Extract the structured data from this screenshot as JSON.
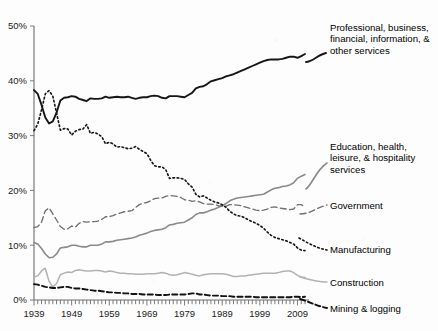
{
  "chart_data": {
    "type": "line",
    "title": "",
    "xlabel": "",
    "ylabel": "",
    "xlim": [
      1939,
      2011
    ],
    "ylim": [
      0,
      50
    ],
    "grid": false,
    "legend_position": "right-inline-labels",
    "y_tick_labels": [
      "0%",
      "10%",
      "20%",
      "30%",
      "40%",
      "50%"
    ],
    "y_tick_values": [
      0,
      10,
      20,
      30,
      40,
      50
    ],
    "x_tick_labels": [
      "1939",
      "1949",
      "1959",
      "1969",
      "1979",
      "1989",
      "1999",
      "2009"
    ],
    "x_tick_values": [
      1939,
      1949,
      1959,
      1969,
      1979,
      1989,
      1999,
      2009
    ],
    "x_minor_tick_interval": 1,
    "units": "percent of total nonfarm employment",
    "series": [
      {
        "name": "Professional, business, financial, information, & other services",
        "style": "solid-bold-black",
        "color": "#161616",
        "x": [
          1939,
          1940,
          1941,
          1942,
          1943,
          1944,
          1945,
          1946,
          1947,
          1948,
          1949,
          1950,
          1951,
          1952,
          1953,
          1954,
          1955,
          1956,
          1957,
          1958,
          1959,
          1960,
          1961,
          1962,
          1963,
          1964,
          1965,
          1966,
          1967,
          1968,
          1969,
          1970,
          1971,
          1972,
          1973,
          1974,
          1975,
          1976,
          1977,
          1978,
          1979,
          1980,
          1981,
          1982,
          1983,
          1984,
          1985,
          1986,
          1987,
          1988,
          1989,
          1990,
          1991,
          1992,
          1993,
          1994,
          1995,
          1996,
          1997,
          1998,
          1999,
          2000,
          2001,
          2002,
          2003,
          2004,
          2005,
          2006,
          2007,
          2008,
          2009,
          2010,
          2011
        ],
        "values": [
          38.3,
          37.6,
          35.6,
          33.3,
          32.2,
          32.6,
          34.2,
          36.4,
          36.9,
          37.0,
          37.2,
          37.1,
          36.7,
          36.5,
          36.3,
          36.8,
          36.7,
          36.7,
          36.8,
          37.1,
          36.9,
          37.0,
          37.1,
          37.0,
          37.0,
          37.1,
          36.9,
          36.7,
          36.9,
          37.0,
          37.0,
          37.2,
          37.3,
          37.2,
          36.9,
          36.8,
          37.2,
          37.2,
          37.2,
          37.1,
          37.0,
          37.4,
          37.8,
          38.6,
          38.9,
          39.0,
          39.4,
          39.9,
          40.1,
          40.3,
          40.5,
          40.8,
          41.0,
          41.2,
          41.5,
          41.8,
          42.1,
          42.4,
          42.7,
          43.0,
          43.3,
          43.6,
          43.8,
          43.9,
          43.9,
          43.9,
          44.0,
          44.2,
          44.4,
          44.4,
          44.2,
          44.5,
          44.9
        ]
      },
      {
        "name": "Education, health, leisure, & hospitality services",
        "style": "solid-gray",
        "color": "#8a8a8a",
        "x": [
          1939,
          1940,
          1941,
          1942,
          1943,
          1944,
          1945,
          1946,
          1947,
          1948,
          1949,
          1950,
          1951,
          1952,
          1953,
          1954,
          1955,
          1956,
          1957,
          1958,
          1959,
          1960,
          1961,
          1962,
          1963,
          1964,
          1965,
          1966,
          1967,
          1968,
          1969,
          1970,
          1971,
          1972,
          1973,
          1974,
          1975,
          1976,
          1977,
          1978,
          1979,
          1980,
          1981,
          1982,
          1983,
          1984,
          1985,
          1986,
          1987,
          1988,
          1989,
          1990,
          1991,
          1992,
          1993,
          1994,
          1995,
          1996,
          1997,
          1998,
          1999,
          2000,
          2001,
          2002,
          2003,
          2004,
          2005,
          2006,
          2007,
          2008,
          2009,
          2010,
          2011
        ],
        "values": [
          10.5,
          10.2,
          9.4,
          8.4,
          7.7,
          7.8,
          8.4,
          9.5,
          9.6,
          9.7,
          10.0,
          10.0,
          9.8,
          9.7,
          9.7,
          10.0,
          10.0,
          10.0,
          10.2,
          10.6,
          10.6,
          10.7,
          10.9,
          11.0,
          11.1,
          11.2,
          11.3,
          11.5,
          11.8,
          12.0,
          12.2,
          12.5,
          12.7,
          12.8,
          12.9,
          13.2,
          13.7,
          13.8,
          14.0,
          14.1,
          14.2,
          14.6,
          15.0,
          15.6,
          15.9,
          15.9,
          16.1,
          16.4,
          16.6,
          16.9,
          17.2,
          17.6,
          18.1,
          18.4,
          18.6,
          18.7,
          18.8,
          18.9,
          19.0,
          19.1,
          19.2,
          19.3,
          19.7,
          20.1,
          20.4,
          20.5,
          20.7,
          20.8,
          21.0,
          21.4,
          22.2,
          22.6,
          22.9
        ]
      },
      {
        "name": "Government",
        "style": "dashed-gray",
        "color": "#6f6f6f",
        "x": [
          1939,
          1940,
          1941,
          1942,
          1943,
          1944,
          1945,
          1946,
          1947,
          1948,
          1949,
          1950,
          1951,
          1952,
          1953,
          1954,
          1955,
          1956,
          1957,
          1958,
          1959,
          1960,
          1961,
          1962,
          1963,
          1964,
          1965,
          1966,
          1967,
          1968,
          1969,
          1970,
          1971,
          1972,
          1973,
          1974,
          1975,
          1976,
          1977,
          1978,
          1979,
          1980,
          1981,
          1982,
          1983,
          1984,
          1985,
          1986,
          1987,
          1988,
          1989,
          1990,
          1991,
          1992,
          1993,
          1994,
          1995,
          1996,
          1997,
          1998,
          1999,
          2000,
          2001,
          2002,
          2003,
          2004,
          2005,
          2006,
          2007,
          2008,
          2009,
          2010,
          2011
        ],
        "values": [
          13.2,
          13.4,
          14.2,
          16.3,
          16.8,
          15.7,
          14.6,
          13.4,
          12.9,
          13.0,
          13.5,
          13.3,
          14.0,
          14.3,
          14.2,
          14.3,
          14.3,
          14.4,
          14.7,
          15.2,
          15.2,
          15.4,
          15.7,
          15.9,
          16.1,
          16.2,
          16.3,
          16.9,
          17.4,
          17.7,
          17.8,
          18.1,
          18.5,
          18.6,
          18.6,
          18.9,
          19.1,
          19.0,
          18.9,
          18.7,
          18.3,
          18.2,
          18.0,
          18.1,
          17.9,
          17.6,
          17.5,
          17.5,
          17.4,
          17.2,
          17.1,
          17.1,
          17.4,
          17.4,
          17.3,
          17.2,
          17.0,
          16.8,
          16.6,
          16.4,
          16.3,
          16.4,
          16.6,
          16.9,
          17.0,
          16.8,
          16.7,
          16.6,
          16.5,
          16.6,
          17.4,
          17.4,
          17.0
        ]
      },
      {
        "name": "Manufacturing",
        "style": "dotted-black",
        "color": "#181818",
        "x": [
          1939,
          1940,
          1941,
          1942,
          1943,
          1944,
          1945,
          1946,
          1947,
          1948,
          1949,
          1950,
          1951,
          1952,
          1953,
          1954,
          1955,
          1956,
          1957,
          1958,
          1959,
          1960,
          1961,
          1962,
          1963,
          1964,
          1965,
          1966,
          1967,
          1968,
          1969,
          1970,
          1971,
          1972,
          1973,
          1974,
          1975,
          1976,
          1977,
          1978,
          1979,
          1980,
          1981,
          1982,
          1983,
          1984,
          1985,
          1986,
          1987,
          1988,
          1989,
          1990,
          1991,
          1992,
          1993,
          1994,
          1995,
          1996,
          1997,
          1998,
          1999,
          2000,
          2001,
          2002,
          2003,
          2004,
          2005,
          2006,
          2007,
          2008,
          2009,
          2010,
          2011
        ],
        "values": [
          30.9,
          32.1,
          34.7,
          37.6,
          38.2,
          37.2,
          34.1,
          31.0,
          31.3,
          31.2,
          30.1,
          30.8,
          31.1,
          31.2,
          32.0,
          30.4,
          30.6,
          30.3,
          29.8,
          28.5,
          28.8,
          28.5,
          27.9,
          28.0,
          27.8,
          27.6,
          27.7,
          28.0,
          27.5,
          27.1,
          26.7,
          25.5,
          24.5,
          24.3,
          24.3,
          23.8,
          22.2,
          22.3,
          22.3,
          22.2,
          22.0,
          21.2,
          20.6,
          19.3,
          18.8,
          19.0,
          18.6,
          18.2,
          17.9,
          17.7,
          17.4,
          16.9,
          16.2,
          15.7,
          15.4,
          15.3,
          15.0,
          14.6,
          14.3,
          14.0,
          13.6,
          13.1,
          12.4,
          11.8,
          11.4,
          11.2,
          11.0,
          10.8,
          10.5,
          10.2,
          9.5,
          9.1,
          9.0
        ]
      },
      {
        "name": "Construction",
        "style": "solid-lightgray",
        "color": "#b2b2b2",
        "x": [
          1939,
          1940,
          1941,
          1942,
          1943,
          1944,
          1945,
          1946,
          1947,
          1948,
          1949,
          1950,
          1951,
          1952,
          1953,
          1954,
          1955,
          1956,
          1957,
          1958,
          1959,
          1960,
          1961,
          1962,
          1963,
          1964,
          1965,
          1966,
          1967,
          1968,
          1969,
          1970,
          1971,
          1972,
          1973,
          1974,
          1975,
          1976,
          1977,
          1978,
          1979,
          1980,
          1981,
          1982,
          1983,
          1984,
          1985,
          1986,
          1987,
          1988,
          1989,
          1990,
          1991,
          1992,
          1993,
          1994,
          1995,
          1996,
          1997,
          1998,
          1999,
          2000,
          2001,
          2002,
          2003,
          2004,
          2005,
          2006,
          2007,
          2008,
          2009,
          2010,
          2011
        ],
        "values": [
          4.2,
          4.4,
          5.3,
          5.8,
          3.4,
          2.4,
          3.0,
          4.6,
          4.9,
          5.1,
          5.0,
          5.4,
          5.5,
          5.4,
          5.3,
          5.3,
          5.4,
          5.4,
          5.3,
          5.1,
          5.3,
          5.2,
          5.0,
          4.9,
          4.9,
          4.8,
          4.8,
          4.7,
          4.7,
          4.7,
          4.8,
          4.8,
          4.8,
          4.9,
          5.0,
          4.9,
          4.6,
          4.5,
          4.6,
          4.8,
          5.0,
          4.9,
          4.7,
          4.5,
          4.4,
          4.6,
          4.7,
          4.8,
          4.8,
          4.8,
          4.8,
          4.7,
          4.5,
          4.3,
          4.3,
          4.4,
          4.4,
          4.5,
          4.6,
          4.7,
          4.8,
          4.9,
          4.9,
          4.9,
          4.9,
          5.0,
          5.2,
          5.3,
          5.3,
          5.0,
          4.5,
          4.2,
          4.1
        ]
      },
      {
        "name": "Mining & logging",
        "style": "dashed-bold-black",
        "color": "#111111",
        "x": [
          1939,
          1940,
          1941,
          1942,
          1943,
          1944,
          1945,
          1946,
          1947,
          1948,
          1949,
          1950,
          1951,
          1952,
          1953,
          1954,
          1955,
          1956,
          1957,
          1958,
          1959,
          1960,
          1961,
          1962,
          1963,
          1964,
          1965,
          1966,
          1967,
          1968,
          1969,
          1970,
          1971,
          1972,
          1973,
          1974,
          1975,
          1976,
          1977,
          1978,
          1979,
          1980,
          1981,
          1982,
          1983,
          1984,
          1985,
          1986,
          1987,
          1988,
          1989,
          1990,
          1991,
          1992,
          1993,
          1994,
          1995,
          1996,
          1997,
          1998,
          1999,
          2000,
          2001,
          2002,
          2003,
          2004,
          2005,
          2006,
          2007,
          2008,
          2009,
          2010,
          2011
        ],
        "values": [
          2.9,
          2.8,
          2.6,
          2.4,
          2.3,
          2.2,
          2.2,
          2.3,
          2.4,
          2.4,
          2.2,
          2.1,
          2.1,
          2.0,
          1.9,
          1.8,
          1.7,
          1.7,
          1.6,
          1.5,
          1.4,
          1.4,
          1.3,
          1.3,
          1.2,
          1.2,
          1.1,
          1.1,
          1.1,
          1.0,
          1.0,
          1.0,
          1.0,
          0.9,
          0.9,
          0.9,
          1.0,
          1.0,
          1.0,
          1.0,
          1.0,
          1.1,
          1.2,
          1.2,
          1.0,
          1.0,
          0.9,
          0.8,
          0.8,
          0.8,
          0.7,
          0.7,
          0.7,
          0.6,
          0.6,
          0.6,
          0.6,
          0.6,
          0.6,
          0.5,
          0.5,
          0.5,
          0.5,
          0.5,
          0.5,
          0.5,
          0.5,
          0.5,
          0.5,
          0.6,
          0.6,
          0.5,
          0.6
        ]
      }
    ]
  },
  "axes": {
    "y_labels": [
      "50%",
      "40%",
      "30%",
      "20%",
      "10%",
      "0%"
    ],
    "x_labels": [
      "1939",
      "1949",
      "1959",
      "1969",
      "1979",
      "1989",
      "1999",
      "2009"
    ]
  },
  "legend": {
    "professional": {
      "line1": "Professional, business,",
      "line2": "financial, information, &",
      "line3": "other services"
    },
    "education": {
      "line1": "Education, health,",
      "line2": "leisure, & hospitality",
      "line3": "services"
    },
    "government": {
      "line1": "Government"
    },
    "manufacturing": {
      "line1": "Manufacturing"
    },
    "construction": {
      "line1": "Construction"
    },
    "mining": {
      "line1": "Mining & logging"
    }
  },
  "colors": {
    "professional": "#161616",
    "education": "#8a8a8a",
    "government": "#6f6f6f",
    "manufacturing": "#181818",
    "construction": "#b2b2b2",
    "mining": "#111111",
    "axis": "#6e6e6e",
    "background": "#fdfdfd"
  }
}
